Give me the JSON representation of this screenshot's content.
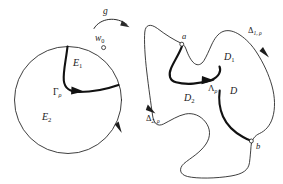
{
  "figure": {
    "background_color": "#ffffff",
    "ink_color": "#1a1a1a",
    "left_panel": {
      "name": "unit-disk-panel",
      "labels": {
        "map": "g",
        "boundary_point": "w",
        "boundary_point_sub": "0",
        "region_upper": "E",
        "region_upper_sub": "1",
        "region_lower": "E",
        "region_lower_sub": "2",
        "crosscut": "Γ",
        "crosscut_sub": "ρ"
      }
    },
    "right_panel": {
      "name": "jordan-domain-panel",
      "labels": {
        "point_a": "a",
        "point_b": "b",
        "subdomain_upper": "D",
        "subdomain_upper_sub": "1",
        "subdomain_lower": "D",
        "subdomain_lower_sub": "2",
        "domain": "D",
        "crosscut": "Λ",
        "crosscut_sub": "ρ",
        "boundary_arc_upper": "Δ",
        "boundary_arc_upper_sub": "1, ρ",
        "boundary_arc_lower": "Δ",
        "boundary_arc_lower_sub": "2, ρ"
      }
    }
  }
}
